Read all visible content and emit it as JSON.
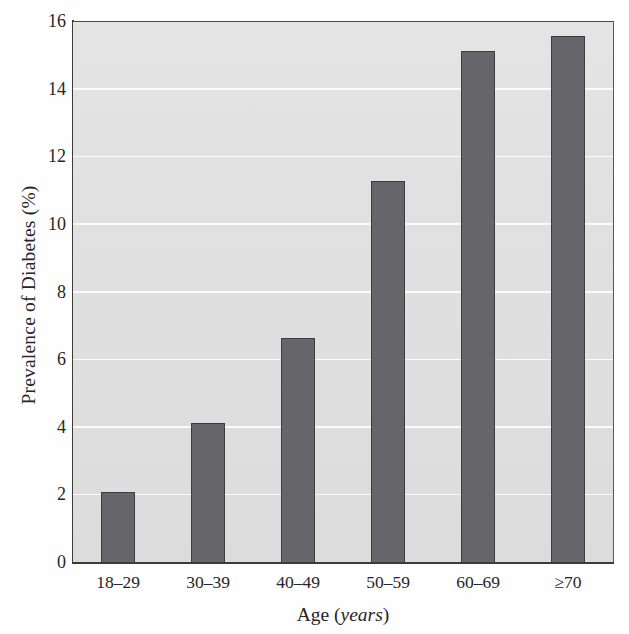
{
  "chart_data": {
    "type": "bar",
    "title": "",
    "subtitle": "",
    "categories": [
      "18–29",
      "30–39",
      "40–49",
      "50–59",
      "60–69",
      "≥70"
    ],
    "values": [
      2.1,
      4.15,
      6.65,
      11.3,
      15.15,
      15.6
    ],
    "xlabel": "Age (years)",
    "xlabel_text": "Age (",
    "xlabel_unit": "years",
    "xlabel_close": ")",
    "ylabel": "Prevalence of Diabetes (%)",
    "ylim": [
      0,
      16
    ],
    "xlim_note": "categorical",
    "yticks": [
      0,
      2,
      4,
      6,
      8,
      10,
      12,
      14,
      16
    ],
    "ytick_labels": [
      "0",
      "2",
      "4",
      "6",
      "8",
      "10",
      "12",
      "14",
      "16"
    ],
    "grid": "horizontal",
    "gridline_color": "#fbfbfb",
    "legend": "none",
    "legend_position": "none",
    "bar_color": "#66666a",
    "bar_edge_color": "#3d3d41",
    "plot_background": "#e1e1e1",
    "figure_background": "#fefefe",
    "axis_color": "#3c3c3c",
    "annotations": []
  }
}
